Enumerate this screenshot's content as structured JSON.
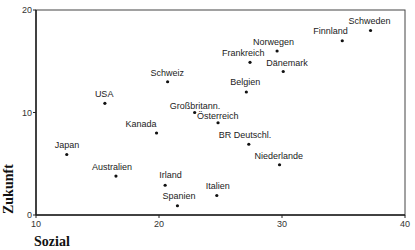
{
  "chart_data": {
    "type": "scatter",
    "title": "",
    "xlabel": "Sozial",
    "ylabel": "Zukunft",
    "xlim": [
      10,
      40
    ],
    "ylim": [
      0,
      20
    ],
    "xticks": [
      10,
      20,
      30,
      40
    ],
    "yticks": [
      0,
      10,
      20
    ],
    "grid": false,
    "legend": null,
    "points": [
      {
        "label": "Schweden",
        "x": 37.2,
        "y": 18.0
      },
      {
        "label": "Finnland",
        "x": 34.9,
        "y": 17.0
      },
      {
        "label": "Norwegen",
        "x": 29.6,
        "y": 16.0
      },
      {
        "label": "Frankreich",
        "x": 27.4,
        "y": 14.9
      },
      {
        "label": "Dänemark",
        "x": 30.1,
        "y": 14.0
      },
      {
        "label": "Belgien",
        "x": 27.1,
        "y": 12.0
      },
      {
        "label": "Schweiz",
        "x": 20.7,
        "y": 13.0
      },
      {
        "label": "USA",
        "x": 15.6,
        "y": 10.9
      },
      {
        "label": "Großbritann.",
        "x": 22.9,
        "y": 10.0
      },
      {
        "label": "Österreich",
        "x": 24.8,
        "y": 9.0
      },
      {
        "label": "Kanada",
        "x": 19.8,
        "y": 8.0
      },
      {
        "label": "BR Deutschl.",
        "x": 27.3,
        "y": 6.9
      },
      {
        "label": "Niederlande",
        "x": 29.8,
        "y": 4.9
      },
      {
        "label": "Japan",
        "x": 12.5,
        "y": 5.9
      },
      {
        "label": "Australien",
        "x": 16.5,
        "y": 3.8
      },
      {
        "label": "Irland",
        "x": 20.5,
        "y": 2.9
      },
      {
        "label": "Italien",
        "x": 24.7,
        "y": 1.9
      },
      {
        "label": "Spanien",
        "x": 21.5,
        "y": 0.9
      }
    ]
  },
  "layout": {
    "label_offsets": {
      "Schweden": [
        -22,
        -7
      ],
      "Finnland": [
        -29,
        -7
      ],
      "Norwegen": [
        -24,
        -6
      ],
      "Frankreich": [
        -28,
        -6
      ],
      "Dänemark": [
        -17,
        -6
      ],
      "Belgien": [
        -16,
        -7
      ],
      "Schweiz": [
        -17,
        -6
      ],
      "USA": [
        -10,
        -6
      ],
      "Großbritann.": [
        -25,
        -4
      ],
      "Österreich": [
        -21,
        -4
      ],
      "Kanada": [
        -31,
        -6
      ],
      "BR Deutschl.": [
        -30,
        -6
      ],
      "Niederlande": [
        -25,
        -6
      ],
      "Japan": [
        -12,
        -7
      ],
      "Australien": [
        -24,
        -6
      ],
      "Irland": [
        -6,
        -7
      ],
      "Italien": [
        -11,
        -7
      ],
      "Spanien": [
        -15,
        -7
      ]
    }
  }
}
